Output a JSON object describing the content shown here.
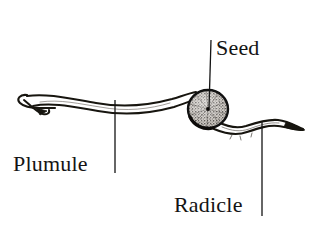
{
  "figure": {
    "kind": "botanical-line-illustration",
    "background_color": "#ffffff",
    "ink_color": "#141414",
    "width": 322,
    "height": 232
  },
  "labels": {
    "seed": "Seed",
    "plumule": "Plumule",
    "radicle": "Radicle"
  },
  "leader_lines": {
    "seed": {
      "x": 211,
      "y_top": 40,
      "y_bottom": 109
    },
    "plumule": {
      "x": 115,
      "y_top": 100,
      "y_bottom": 173
    },
    "radicle": {
      "x": 262,
      "y_top": 122,
      "y_bottom": 216
    }
  },
  "parts": {
    "seed": {
      "name": "seed",
      "shape": "stippled-oval",
      "center_x": 208,
      "center_y": 109,
      "radius_x": 20,
      "radius_y": 19
    },
    "plumule": {
      "name": "plumule",
      "shape": "hooked-shoot",
      "description": "shepherd's crook tip curling left and down"
    },
    "radicle": {
      "name": "radicle",
      "shape": "wavy-root",
      "description": "tapering wavy root extending to the right"
    }
  },
  "icons": {
    "seed": "seed-icon",
    "plumule": "shoot-icon",
    "radicle": "root-icon"
  }
}
